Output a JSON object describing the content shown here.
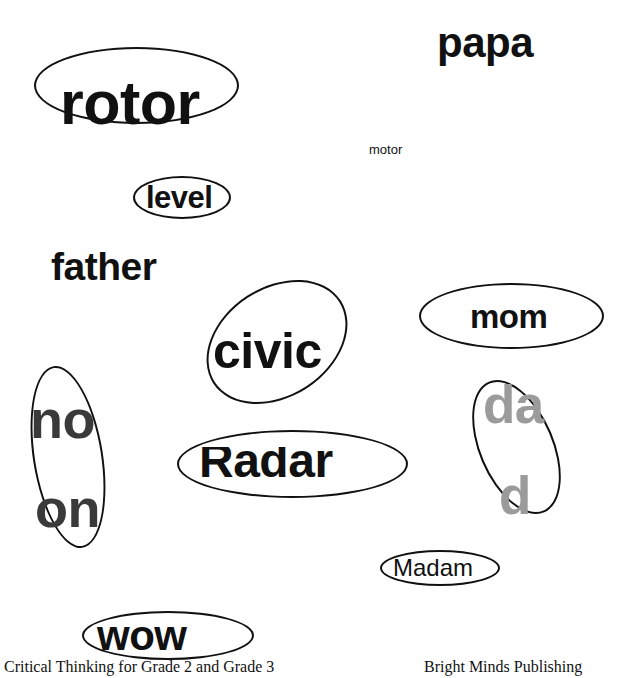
{
  "page": {
    "width": 632,
    "height": 678,
    "background_color": "#ffffff",
    "ink_color": "#111111"
  },
  "words": {
    "rotor": "rotor",
    "papa": "papa",
    "motor": "motor",
    "level": "level",
    "father": "father",
    "civic": "civic",
    "mom": "mom",
    "dad_part_a": "da",
    "dad_part_b": "d",
    "no": "no",
    "on": "on",
    "radar": "Radar",
    "madam": "Madam",
    "wow": "wow"
  },
  "colors": {
    "black": "#111111",
    "dark_gray": "#3a3a3a",
    "light_gray": "#9b9b9b"
  },
  "footer": {
    "left": "Critical Thinking for Grade 2 and Grade 3",
    "right": "Bright Minds Publishing"
  }
}
